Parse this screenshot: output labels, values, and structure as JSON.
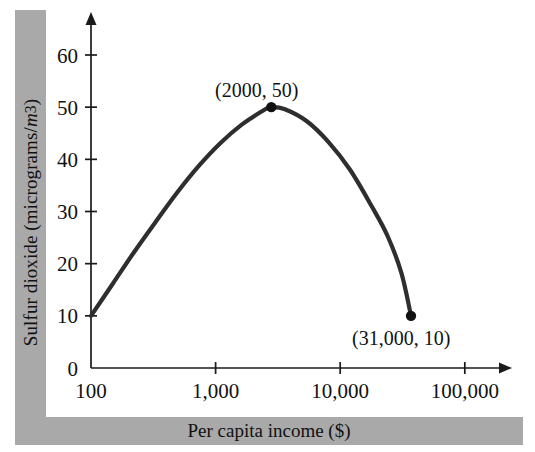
{
  "chart_data": {
    "type": "line",
    "title": "",
    "subtitle": "",
    "xlabel": "Per capita income ($)",
    "ylabel": "Sulfur dioxide (micrograms/m³)",
    "ylabel_parts": {
      "prefix": "Sulfur dioxide (micrograms/",
      "italic_unit": "m",
      "superscript": "3",
      "suffix": ")"
    },
    "x_scale": "log",
    "y_scale": "linear",
    "xlim": [
      100,
      200000
    ],
    "ylim": [
      0,
      67
    ],
    "grid": false,
    "legend": "none",
    "x_tick_labels": [
      "100",
      "1,000",
      "10,000",
      "100,000"
    ],
    "x_tick_values": [
      100,
      1000,
      10000,
      100000
    ],
    "y_tick_labels": [
      "0",
      "10",
      "20",
      "30",
      "40",
      "50",
      "60"
    ],
    "y_tick_values": [
      0,
      10,
      20,
      30,
      40,
      50,
      60
    ],
    "series": [
      {
        "name": "Sulfur dioxide vs per capita income",
        "color": "#2e2e2e",
        "x": [
          100,
          150,
          220,
          330,
          490,
          730,
          1090,
          1630,
          2430,
          2800,
          3600,
          5400,
          8000,
          12000,
          18000,
          24000,
          31000,
          37000
        ],
        "y": [
          10,
          16.2,
          22.1,
          28.0,
          33.6,
          38.7,
          43.1,
          46.7,
          49.4,
          50.0,
          49.6,
          47.3,
          43.4,
          38.0,
          30.9,
          25.3,
          18.2,
          10.0
        ]
      }
    ],
    "markers": [
      {
        "name": "peak-point",
        "x": 2800,
        "y": 50.0,
        "label": "(2000, 50)",
        "label_dx": -60,
        "label_dy": -16
      },
      {
        "name": "end-point",
        "x": 37000,
        "y": 10.0,
        "label": "(31,000, 10)",
        "label_dx": -55,
        "label_dy": 34
      }
    ],
    "annotations": [
      {
        "text": "(2000, 50)",
        "x_px": 215,
        "y_px": 97
      },
      {
        "text": "(31,000, 10)",
        "x_px": 352,
        "y_px": 345
      }
    ],
    "colors": {
      "curve": "#2e2e2e",
      "axis": "#1a1a1a",
      "band": "#a9a9a9",
      "background": "#ffffff",
      "text": "#111111"
    }
  }
}
